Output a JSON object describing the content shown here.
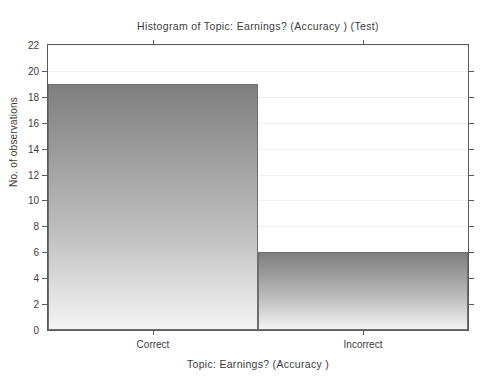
{
  "chart_data": {
    "type": "bar",
    "title": "Histogram of  Topic: Earnings? (Accuracy ) (Test)",
    "xlabel": "Topic: Earnings? (Accuracy )",
    "ylabel": "No. of observations",
    "categories": [
      "Correct",
      "Incorrect"
    ],
    "values": [
      19,
      6
    ],
    "ylim": [
      0,
      22
    ],
    "ytick_labels": [
      "0",
      "2",
      "4",
      "6",
      "8",
      "10",
      "12",
      "14",
      "16",
      "18",
      "20",
      "22"
    ],
    "ytick_values": [
      0,
      2,
      4,
      6,
      8,
      10,
      12,
      14,
      16,
      18,
      20,
      22
    ],
    "grid": true,
    "legend": null,
    "colors": {
      "bar_top": "#7f7f7f",
      "bar_bottom": "#f4f4f4",
      "bar_edge": "#6e6e6e",
      "axis": "#5a5a5a",
      "grid": "#f0f0f0",
      "text": "#3c3c3c",
      "background": "#ffffff"
    }
  }
}
